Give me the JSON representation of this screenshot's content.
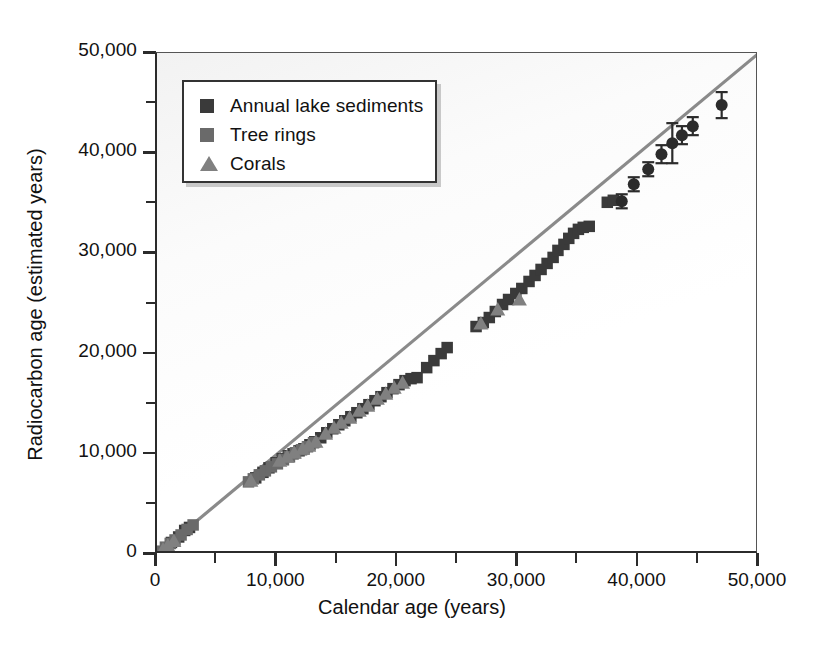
{
  "chart_data": {
    "type": "scatter",
    "title": "",
    "xlabel": "Calendar age (years)",
    "ylabel": "Radiocarbon age (estimated years)",
    "xlim": [
      0,
      50000
    ],
    "ylim": [
      0,
      50000
    ],
    "grid": false,
    "legend_position": "top-left",
    "xticks": [
      0,
      10000,
      20000,
      30000,
      40000,
      50000
    ],
    "yticks": [
      0,
      10000,
      20000,
      30000,
      40000,
      50000
    ],
    "xtick_labels": [
      "0",
      "10,000",
      "20,000",
      "30,000",
      "40,000",
      "50,000"
    ],
    "ytick_labels": [
      "0",
      "10,000",
      "20,000",
      "30,000",
      "40,000",
      "50,000"
    ],
    "minor_tick_interval": 5000,
    "reference_line": {
      "label": "1:1 line",
      "from": [
        0,
        0
      ],
      "to": [
        50000,
        50000
      ],
      "color": "#8a8a8a"
    },
    "series": [
      {
        "name": "Annual lake sediments",
        "marker": "square",
        "color": "#3a3a3a",
        "points": [
          [
            1200,
            1150
          ],
          [
            1800,
            1700
          ],
          [
            2300,
            2350
          ],
          [
            2700,
            2650
          ],
          [
            8200,
            7600
          ],
          [
            8800,
            8150
          ],
          [
            9300,
            8600
          ],
          [
            9900,
            9100
          ],
          [
            10400,
            9500
          ],
          [
            10900,
            9800
          ],
          [
            11300,
            10000
          ],
          [
            11800,
            10300
          ],
          [
            12200,
            10500
          ],
          [
            12700,
            10900
          ],
          [
            13100,
            11200
          ],
          [
            13600,
            11600
          ],
          [
            14100,
            12100
          ],
          [
            14600,
            12500
          ],
          [
            15100,
            12900
          ],
          [
            15600,
            13300
          ],
          [
            16100,
            13700
          ],
          [
            16600,
            14100
          ],
          [
            17100,
            14500
          ],
          [
            17600,
            14900
          ],
          [
            18100,
            15300
          ],
          [
            18600,
            15700
          ],
          [
            19100,
            16100
          ],
          [
            19600,
            16500
          ],
          [
            20100,
            16900
          ],
          [
            20600,
            17300
          ],
          [
            21100,
            17500
          ],
          [
            21600,
            17600
          ],
          [
            22400,
            18600
          ],
          [
            23000,
            19300
          ],
          [
            23600,
            20000
          ],
          [
            24100,
            20600
          ],
          [
            26500,
            22700
          ],
          [
            27100,
            23100
          ],
          [
            27600,
            23600
          ],
          [
            28100,
            24200
          ],
          [
            28700,
            24900
          ],
          [
            29200,
            25400
          ],
          [
            29800,
            26000
          ],
          [
            30300,
            26500
          ],
          [
            30900,
            27200
          ],
          [
            31400,
            27800
          ],
          [
            31900,
            28400
          ],
          [
            32400,
            29000
          ],
          [
            32900,
            29600
          ],
          [
            33300,
            30300
          ],
          [
            33800,
            30900
          ],
          [
            34200,
            31500
          ],
          [
            34600,
            32000
          ],
          [
            35000,
            32400
          ],
          [
            35400,
            32600
          ],
          [
            35900,
            32700
          ],
          [
            37400,
            35100
          ],
          [
            37900,
            35300
          ]
        ]
      },
      {
        "name": "Tree rings",
        "marker": "square",
        "color": "#6a6a6a",
        "points": [
          [
            300,
            280
          ],
          [
            700,
            680
          ],
          [
            1100,
            1050
          ],
          [
            1500,
            1400
          ],
          [
            2000,
            1900
          ],
          [
            2500,
            2450
          ],
          [
            3000,
            2900
          ],
          [
            7600,
            7200
          ],
          [
            8000,
            7500
          ],
          [
            8500,
            7900
          ],
          [
            9000,
            8300
          ],
          [
            9500,
            8700
          ],
          [
            10000,
            9000
          ],
          [
            10500,
            9400
          ],
          [
            11000,
            9700
          ],
          [
            11500,
            10100
          ],
          [
            12000,
            10400
          ],
          [
            12500,
            10700
          ],
          [
            13000,
            11100
          ]
        ]
      },
      {
        "name": "Corals",
        "marker": "triangle",
        "color": "#808080",
        "points": [
          [
            500,
            450
          ],
          [
            900,
            850
          ],
          [
            1400,
            1300
          ],
          [
            7800,
            7300
          ],
          [
            10200,
            9300
          ],
          [
            10800,
            9700
          ],
          [
            11400,
            10100
          ],
          [
            12100,
            10500
          ],
          [
            12600,
            10800
          ],
          [
            13200,
            11200
          ],
          [
            14000,
            12000
          ],
          [
            14700,
            12600
          ],
          [
            15300,
            13100
          ],
          [
            16000,
            13600
          ],
          [
            16800,
            14300
          ],
          [
            17500,
            14800
          ],
          [
            18300,
            15500
          ],
          [
            19000,
            16000
          ],
          [
            19700,
            16600
          ],
          [
            20400,
            17100
          ],
          [
            26900,
            23000
          ],
          [
            28300,
            24400
          ],
          [
            30100,
            25400
          ]
        ]
      }
    ],
    "error_bar_points": {
      "name": "High-age points with uncertainty",
      "marker": "circle",
      "color": "#2b2b2b",
      "points": [
        {
          "x": 38600,
          "y": 35200,
          "yerr": 700
        },
        {
          "x": 39600,
          "y": 36900,
          "yerr": 700
        },
        {
          "x": 40800,
          "y": 38400,
          "yerr": 700
        },
        {
          "x": 41900,
          "y": 39900,
          "yerr": 900
        },
        {
          "x": 42800,
          "y": 41000,
          "yerr": 2000
        },
        {
          "x": 43600,
          "y": 41800,
          "yerr": 900
        },
        {
          "x": 44500,
          "y": 42700,
          "yerr": 900
        },
        {
          "x": 46900,
          "y": 44800,
          "yerr": 1300
        }
      ]
    }
  },
  "legend": {
    "items": [
      {
        "label": "Annual lake sediments",
        "marker": "square",
        "color": "#3a3a3a"
      },
      {
        "label": "Tree rings",
        "marker": "square",
        "color": "#6a6a6a"
      },
      {
        "label": "Corals",
        "marker": "triangle",
        "color": "#808080"
      }
    ]
  }
}
